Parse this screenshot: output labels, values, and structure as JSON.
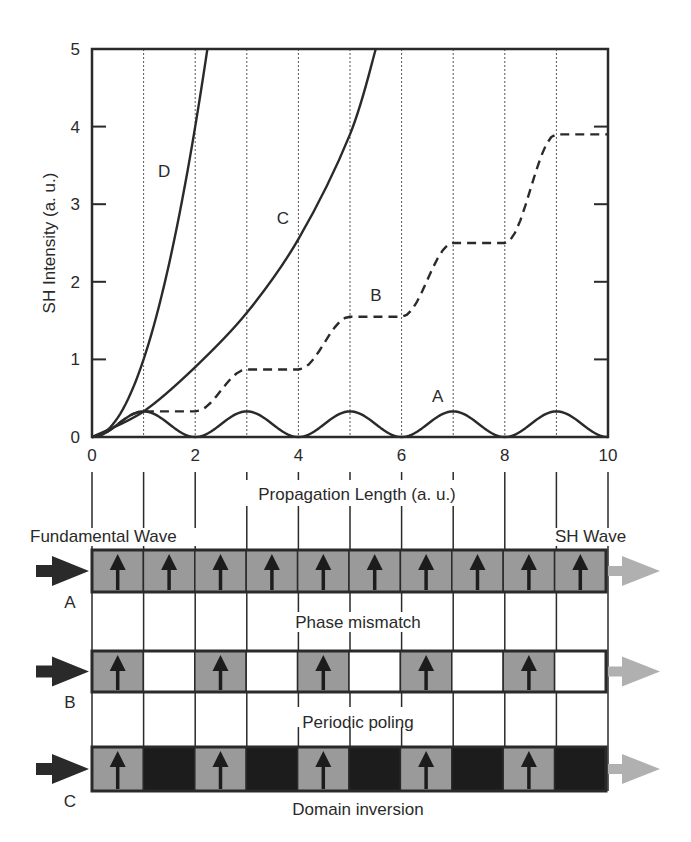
{
  "chart_data": {
    "type": "line",
    "title": "",
    "xlabel": "Propagation Length (a. u.)",
    "ylabel": "SH Intensity (a. u.)",
    "xlim": [
      0,
      10
    ],
    "ylim": [
      0,
      5
    ],
    "x_ticks": [
      "0",
      "2",
      "4",
      "6",
      "8",
      "10"
    ],
    "y_ticks": [
      "0",
      "1",
      "2",
      "3",
      "4",
      "5"
    ],
    "grid": "dotted vertical lines at every integer x",
    "legend": "inline curve labels",
    "series": [
      {
        "name": "A",
        "style": "solid",
        "description": "Phase mismatch: oscillates between 0 and ~0.33, period 2",
        "x": [
          0,
          0.5,
          1,
          1.5,
          2,
          2.5,
          3,
          3.5,
          4,
          4.5,
          5,
          5.5,
          6,
          6.5,
          7,
          7.5,
          8,
          8.5,
          9,
          9.5,
          10
        ],
        "values": [
          0,
          0.165,
          0.33,
          0.165,
          0,
          0.165,
          0.33,
          0.165,
          0,
          0.165,
          0.33,
          0.165,
          0,
          0.165,
          0.33,
          0.165,
          0,
          0.165,
          0.33,
          0.165,
          0
        ]
      },
      {
        "name": "B",
        "style": "dashed",
        "description": "Periodic poling: stepwise growth with plateaus",
        "x": [
          0,
          1,
          2,
          3,
          4,
          5,
          6,
          7,
          8,
          9,
          10
        ],
        "values": [
          0,
          0.33,
          0.33,
          0.87,
          0.87,
          1.55,
          1.55,
          2.5,
          2.5,
          3.9,
          3.9
        ]
      },
      {
        "name": "C",
        "style": "solid",
        "description": "Domain inversion (QPM): quasi-quadratic growth with kinks",
        "x": [
          0,
          1,
          2,
          3,
          4,
          5,
          5.5
        ],
        "values": [
          0,
          0.33,
          0.9,
          1.6,
          2.55,
          3.9,
          5.0
        ]
      },
      {
        "name": "D",
        "style": "solid",
        "description": "Perfect phase matching: quadratic growth",
        "x": [
          0,
          1,
          1.5,
          2,
          2.25
        ],
        "values": [
          0,
          1.0,
          2.25,
          4.0,
          5.0
        ]
      }
    ],
    "annotations": [
      {
        "text": "A",
        "x": 6.7,
        "y": 0.45
      },
      {
        "text": "B",
        "x": 5.5,
        "y": 1.75
      },
      {
        "text": "C",
        "x": 3.7,
        "y": 2.75
      },
      {
        "text": "D",
        "x": 1.4,
        "y": 3.35
      }
    ]
  },
  "diagram": {
    "input_label": "Fundamental Wave",
    "output_label": "SH Wave",
    "segments": 10,
    "rows": [
      {
        "id": "A",
        "caption": "Phase mismatch",
        "pattern": [
          "up",
          "up",
          "up",
          "up",
          "up",
          "up",
          "up",
          "up",
          "up",
          "up"
        ]
      },
      {
        "id": "B",
        "caption": "Periodic poling",
        "pattern": [
          "up",
          "empty",
          "up",
          "empty",
          "up",
          "empty",
          "up",
          "empty",
          "up",
          "empty"
        ]
      },
      {
        "id": "C",
        "caption": "Domain inversion",
        "pattern": [
          "up",
          "inverted",
          "up",
          "inverted",
          "up",
          "inverted",
          "up",
          "inverted",
          "up",
          "inverted"
        ]
      }
    ],
    "colors": {
      "up_fill": "#9a9a9a",
      "inverted_fill": "#1c1c1c",
      "empty_fill": "#ffffff",
      "input_arrow": "#2a2a2a",
      "output_arrow": "#b0b0b0",
      "line": "#2a2a2a"
    }
  }
}
